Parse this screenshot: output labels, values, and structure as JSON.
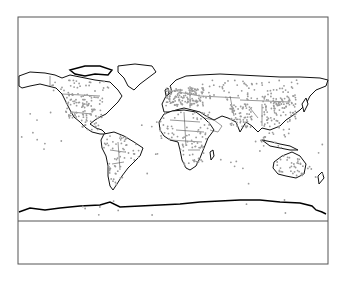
{
  "figure": {
    "type": "world-map-station-distribution",
    "frame": {
      "x": 18,
      "y": 17,
      "width": 310,
      "height": 247
    },
    "map_area": {
      "x": 18,
      "y": 17,
      "width": 310,
      "height": 204
    },
    "legend_area": {
      "x": 18,
      "y": 221,
      "width": 310,
      "height": 43,
      "text": ""
    },
    "projection": "equirectangular",
    "colors": {
      "coastline": "#111111",
      "borders": "#333333",
      "stations": "#9a9a9a",
      "background": "#ffffff"
    },
    "station_density": {
      "high": [
        "Europe",
        "Eastern North America",
        "India",
        "Eastern China",
        "Japan"
      ],
      "medium": [
        "Western North America",
        "Central America",
        "South America",
        "Africa",
        "Southeast Asia",
        "Australia",
        "Russia"
      ],
      "low": [
        "Pacific Islands",
        "Atlantic Islands",
        "Indian Ocean",
        "Antarctica"
      ]
    }
  }
}
